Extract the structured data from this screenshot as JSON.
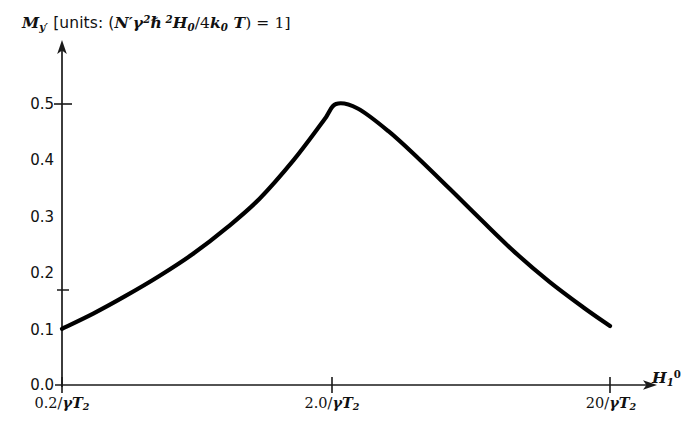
{
  "figure": {
    "background_color": "#ffffff",
    "ink_color": "#111111",
    "curve_color": "#000000"
  },
  "title": {
    "quantity": "M",
    "quantity_sub": "y′",
    "bracket_open": " [units: (",
    "n_prime": "N′",
    "gamma": "γ",
    "gamma_exp": "2",
    "hbar": "ℏ",
    "hbar_exp": "2",
    "h_field": "H",
    "h_field_sub": "0",
    "slash_four": "/4",
    "k_boltz": "k",
    "k_boltz_sub": "0",
    "temperature": "T",
    "bracket_close": ") = 1]",
    "full_text": "M_y′ [units: (N′γ²ℏ²H₀/4k₀T) = 1]"
  },
  "axes": {
    "x_axis_name_base": "H",
    "x_axis_name_sub": "1",
    "x_axis_name_sup": "0",
    "x_axis_name_full": "H₁⁰",
    "y_ticks": [
      "0.5",
      "0.4",
      "0.3",
      "0.2",
      "0.1",
      "0.0"
    ],
    "y_tick_values": [
      0.5,
      0.4,
      0.3,
      0.2,
      0.1,
      0.0
    ],
    "y_ticks_with_marks": [
      "0.5",
      "0.2",
      "0.0"
    ],
    "x_ticks": [
      {
        "value_text": "0.2/",
        "gamma": "γ",
        "t_sym": "T",
        "t_sub": "2",
        "full": "0.2/γT₂"
      },
      {
        "value_text": "2.0/",
        "gamma": "γ",
        "t_sym": "T",
        "t_sub": "2",
        "full": "2.0/γT₂"
      },
      {
        "value_text": "20/",
        "gamma": "γ",
        "t_sym": "T",
        "t_sub": "2",
        "full": "20/γT₂"
      }
    ]
  },
  "chart_data": {
    "type": "line",
    "xlabel": "H₁⁰",
    "ylabel": "M_y′",
    "xscale": "log",
    "grid": false,
    "legend": "none",
    "xlim": [
      0.2,
      20
    ],
    "ylim": [
      0.0,
      0.55
    ],
    "xtick_labels": [
      "0.2/γT₂",
      "2.0/γT₂",
      "20/γT₂"
    ],
    "xtick_values": [
      0.2,
      2.0,
      20
    ],
    "ytick_labels": [
      "0.0",
      "0.1",
      "0.2",
      "0.3",
      "0.4",
      "0.5"
    ],
    "ytick_values": [
      0.0,
      0.1,
      0.2,
      0.3,
      0.4,
      0.5
    ],
    "series": [
      {
        "name": "M_y′ vs H₁⁰",
        "x": [
          0.2,
          0.26,
          0.34,
          0.45,
          0.6,
          0.8,
          1.05,
          1.4,
          1.8,
          2.0,
          2.4,
          3.1,
          4.0,
          5.2,
          6.8,
          9.0,
          12.0,
          16.0,
          20.0
        ],
        "y": [
          0.1,
          0.127,
          0.158,
          0.193,
          0.233,
          0.28,
          0.331,
          0.4,
          0.47,
          0.5,
          0.492,
          0.452,
          0.403,
          0.349,
          0.293,
          0.236,
          0.184,
          0.138,
          0.105
        ]
      }
    ]
  },
  "geometry": {
    "y_axis_x": 62,
    "x_axis_y": 385,
    "y_axis_top": 42,
    "x_axis_right": 658,
    "y_tick_pixels": [
      104,
      160,
      217,
      273,
      330,
      385
    ],
    "x_tick_pixels": [
      62,
      332,
      610
    ]
  }
}
